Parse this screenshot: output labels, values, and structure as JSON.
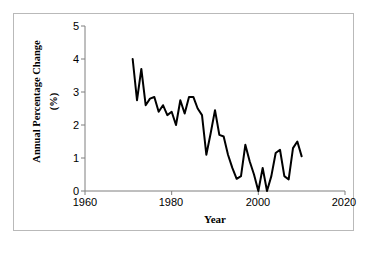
{
  "chart_data": {
    "type": "line",
    "title": "",
    "xlabel": "Year",
    "ylabel": "Annual Percentage Change (%)",
    "ylabel_line1": "Annual Percentage Change",
    "ylabel_line2": "(%)",
    "xlim": [
      1960,
      2020
    ],
    "ylim": [
      0,
      5
    ],
    "xticks": [
      1960,
      1980,
      2000,
      2020
    ],
    "yticks": [
      0,
      1,
      2,
      3,
      4,
      5
    ],
    "xtick_labels": [
      "1960",
      "1980",
      "2000",
      "2020"
    ],
    "ytick_labels": [
      "0",
      "1",
      "2",
      "3",
      "4",
      "5"
    ],
    "grid": false,
    "legend": false,
    "line_color": "#000000",
    "line_width": 2.0,
    "x": [
      1971,
      1972,
      1973,
      1974,
      1975,
      1976,
      1977,
      1978,
      1979,
      1980,
      1981,
      1982,
      1983,
      1984,
      1985,
      1986,
      1987,
      1988,
      1989,
      1990,
      1991,
      1992,
      1993,
      1994,
      1995,
      1996,
      1997,
      1998,
      1999,
      2000,
      2001,
      2002,
      2003,
      2004,
      2005,
      2006,
      2007,
      2008,
      2009,
      2010
    ],
    "values": [
      4.0,
      2.75,
      3.7,
      2.6,
      2.8,
      2.85,
      2.4,
      2.6,
      2.3,
      2.4,
      2.0,
      2.75,
      2.35,
      2.85,
      2.85,
      2.5,
      2.3,
      1.1,
      1.75,
      2.45,
      1.7,
      1.65,
      1.1,
      0.7,
      0.37,
      0.45,
      1.4,
      0.9,
      0.5,
      0.0,
      0.7,
      0.0,
      0.45,
      1.15,
      1.25,
      0.45,
      0.35,
      1.3,
      1.5,
      1.05
    ]
  },
  "axes": {
    "y_axis_name": "y-axis",
    "x_axis_name": "x-axis"
  }
}
